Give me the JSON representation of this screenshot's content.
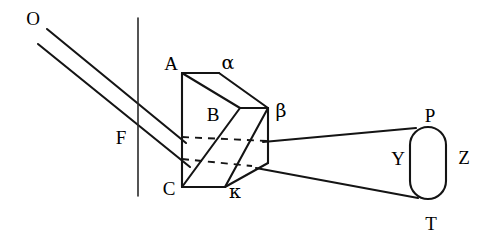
{
  "figure": {
    "background_color": "#ffffff",
    "stroke_color": "#141414",
    "width": 493,
    "height": 244
  },
  "labels": {
    "source": "O",
    "screen": "F",
    "prism_top_left": "A",
    "prism_top_right": "α",
    "prism_mid": "B",
    "prism_right": "β",
    "prism_bottom_left": "C",
    "prism_bottom_right": "κ",
    "lens_top": "P",
    "lens_left": "Y",
    "lens_right": "Z",
    "lens_bottom": "T"
  },
  "label_positions": {
    "source": {
      "x": 33,
      "y": 21
    },
    "screen": {
      "x": 121,
      "y": 140
    },
    "prism_top_left": {
      "x": 171,
      "y": 66
    },
    "prism_top_right": {
      "x": 228,
      "y": 64
    },
    "prism_mid": {
      "x": 213,
      "y": 117
    },
    "prism_right": {
      "x": 281,
      "y": 112
    },
    "prism_bottom_left": {
      "x": 169,
      "y": 191
    },
    "prism_bottom_right": {
      "x": 235,
      "y": 193
    },
    "lens_top": {
      "x": 430,
      "y": 118
    },
    "lens_left": {
      "x": 398,
      "y": 161
    },
    "lens_right": {
      "x": 464,
      "y": 160
    },
    "lens_bottom": {
      "x": 431,
      "y": 226
    }
  },
  "geometry": {
    "screen_line": {
      "x": 138,
      "y1": 18,
      "y2": 196
    },
    "incident_ray_upper": {
      "x1": 47,
      "y1": 29,
      "x2": 186,
      "y2": 143
    },
    "incident_ray_lower": {
      "x1": 38,
      "y1": 44,
      "x2": 190,
      "y2": 167
    },
    "prism_front_face": "182,73 182,187",
    "prism_top_edge": "182,73 219,73",
    "prism_top_slope": "219,73 268,108",
    "prism_mid_edge": "240,108 268,108",
    "prism_front_diagonal": "182,73 240,108",
    "prism_lower_slope": "240,108 268,108 268,163 225,187",
    "prism_bottom_edge": "182,187 225,187",
    "prism_inner_ridge": "240,108 182,187",
    "hidden_edge_upper": "182,138 268,141",
    "hidden_edge_lower": "182,160 250,166",
    "exit_ray_upper": {
      "x1": 263,
      "y1": 142,
      "x2": 416,
      "y2": 128
    },
    "exit_ray_lower": {
      "x1": 258,
      "y1": 168,
      "x2": 418,
      "y2": 198
    },
    "lens": {
      "x": 410,
      "y": 127,
      "width": 36,
      "height": 72,
      "radius": 18
    }
  },
  "elements": [
    {
      "name": "light-source-O",
      "kind": "label"
    },
    {
      "name": "incident-ray-pair",
      "kind": "rays",
      "count": 2
    },
    {
      "name": "screen-line-F",
      "kind": "line"
    },
    {
      "name": "prism-ABC",
      "kind": "solid"
    },
    {
      "name": "exit-ray-pair",
      "kind": "rays",
      "count": 2
    },
    {
      "name": "eye-lens-PYZT",
      "kind": "stadium"
    }
  ]
}
